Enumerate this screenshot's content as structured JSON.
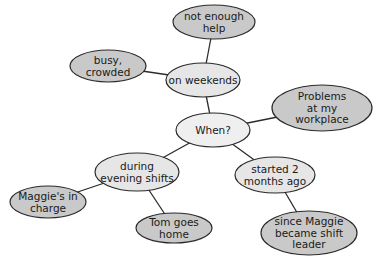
{
  "diagram": {
    "type": "mind-map",
    "colors": {
      "root_fill": "#efefef",
      "branch_fill": "#e6e6e6",
      "leaf_fill": "#c9c9c9",
      "stroke": "#2a2a2a",
      "edge": "#2b2b2b",
      "text": "#1a1a1a"
    },
    "nodes": [
      {
        "id": "when",
        "lines": [
          "When?"
        ],
        "cx": 213,
        "cy": 130,
        "rx": 37,
        "ry": 17,
        "level": "root"
      },
      {
        "id": "weekends",
        "lines": [
          "on weekends"
        ],
        "cx": 203,
        "cy": 80,
        "rx": 37,
        "ry": 17,
        "level": "branch"
      },
      {
        "id": "not-enough-help",
        "lines": [
          "not enough",
          "help"
        ],
        "cx": 214,
        "cy": 22,
        "rx": 41,
        "ry": 17,
        "level": "leaf"
      },
      {
        "id": "busy-crowded",
        "lines": [
          "busy,",
          "crowded"
        ],
        "cx": 108,
        "cy": 66,
        "rx": 38,
        "ry": 16,
        "level": "leaf"
      },
      {
        "id": "problems",
        "lines": [
          "Problems",
          "at my",
          "workplace"
        ],
        "cx": 322,
        "cy": 108,
        "rx": 50,
        "ry": 23,
        "level": "leaf"
      },
      {
        "id": "evening-shifts",
        "lines": [
          "during",
          "evening shifts"
        ],
        "cx": 137,
        "cy": 172,
        "rx": 42,
        "ry": 19,
        "level": "branch"
      },
      {
        "id": "maggies-in-charge",
        "lines": [
          "Maggie's in",
          "charge"
        ],
        "cx": 48,
        "cy": 202,
        "rx": 38,
        "ry": 16,
        "level": "leaf"
      },
      {
        "id": "tom-goes-home",
        "lines": [
          "Tom goes",
          "home"
        ],
        "cx": 174,
        "cy": 228,
        "rx": 38,
        "ry": 15,
        "level": "leaf"
      },
      {
        "id": "started-2-months",
        "lines": [
          "started 2",
          "months ago"
        ],
        "cx": 275,
        "cy": 175,
        "rx": 40,
        "ry": 18,
        "level": "branch"
      },
      {
        "id": "since-maggie",
        "lines": [
          "since Maggie",
          "became shift",
          "leader"
        ],
        "cx": 309,
        "cy": 233,
        "rx": 48,
        "ry": 22,
        "level": "leaf"
      }
    ],
    "edges": [
      {
        "from": "when",
        "to": "weekends"
      },
      {
        "from": "weekends",
        "to": "not-enough-help"
      },
      {
        "from": "weekends",
        "to": "busy-crowded"
      },
      {
        "from": "when",
        "to": "problems"
      },
      {
        "from": "when",
        "to": "evening-shifts"
      },
      {
        "from": "evening-shifts",
        "to": "maggies-in-charge"
      },
      {
        "from": "evening-shifts",
        "to": "tom-goes-home"
      },
      {
        "from": "when",
        "to": "started-2-months"
      },
      {
        "from": "started-2-months",
        "to": "since-maggie"
      }
    ]
  }
}
